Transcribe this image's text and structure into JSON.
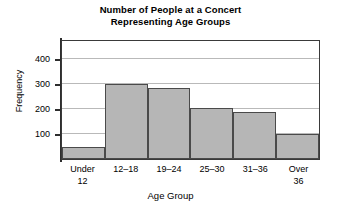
{
  "chart": {
    "title_line1": "Number of People at a Concert",
    "title_line2": "Representing Age Groups"
  },
  "chart_data": {
    "type": "bar",
    "title": "Number of People at a Concert Representing Age Groups",
    "xlabel": "Age Group",
    "ylabel": "Frequency",
    "categories": [
      "Under 12",
      "12–18",
      "19–24",
      "25–30",
      "31–36",
      "Over 36"
    ],
    "category_lines": [
      {
        "l1": "Under",
        "l2": "12"
      },
      {
        "l1": "12–18",
        "l2": ""
      },
      {
        "l1": "19–24",
        "l2": ""
      },
      {
        "l1": "25–30",
        "l2": ""
      },
      {
        "l1": "31–36",
        "l2": ""
      },
      {
        "l1": "Over",
        "l2": "36"
      }
    ],
    "values": [
      50,
      300,
      285,
      205,
      190,
      100
    ],
    "ylim": [
      0,
      480
    ],
    "yticks": [
      100,
      200,
      300,
      400
    ],
    "ytick_labels": [
      "100",
      "200",
      "300",
      "400"
    ],
    "grid": true,
    "legend": false,
    "bar_fill_color": "#b6b6b6",
    "bar_edge_color": "#4a4a4a",
    "axis_color": "#2e2e2e",
    "grid_color": "#b9b9b9"
  }
}
